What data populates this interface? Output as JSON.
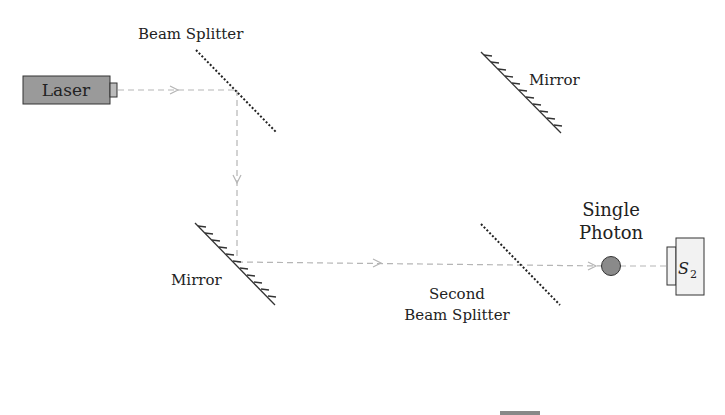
{
  "diagram": {
    "type": "optical-interferometer",
    "components": {
      "laser": {
        "label": "Laser",
        "fill": "#9a9a9a"
      },
      "beam_splitter_1": {
        "label": "Beam Splitter"
      },
      "mirror_top": {
        "label": "Mirror"
      },
      "mirror_bottom": {
        "label": "Mirror"
      },
      "beam_splitter_2": {
        "label_line1": "Second",
        "label_line2": "Beam Splitter"
      },
      "photon": {
        "label_line1": "Single",
        "label_line2": "Photon",
        "fill": "#8a8a8a"
      },
      "detector": {
        "label": "S",
        "subscript": "2",
        "fill": "#f2f2f2"
      }
    },
    "colors": {
      "beam": "#b5b5b5",
      "ink": "#222222"
    }
  }
}
